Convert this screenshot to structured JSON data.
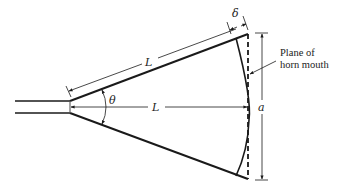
{
  "diagram": {
    "labels": {
      "slant_length": "L",
      "axial_length": "L",
      "path_difference": "δ",
      "flare_angle": "θ",
      "aperture": "a",
      "plane_line1": "Plane of",
      "plane_line2": "horn mouth"
    },
    "colors": {
      "stroke": "#1a1a1a",
      "text": "#222222",
      "background": "#ffffff"
    }
  }
}
